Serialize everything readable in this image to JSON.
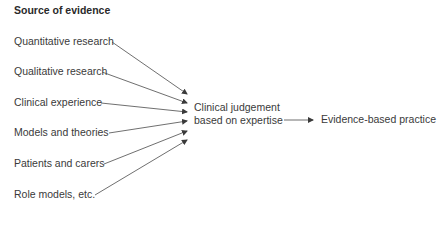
{
  "title": "Source of evidence",
  "sources": [
    {
      "label": "Quantitative research"
    },
    {
      "label": "Qualitative research"
    },
    {
      "label": "Clinical experience"
    },
    {
      "label": "Models and theories"
    },
    {
      "label": "Patients and carers"
    },
    {
      "label": "Role models, etc."
    }
  ],
  "center": {
    "line1": "Clinical judgement",
    "line2": "based on expertise"
  },
  "outcome": "Evidence-based practice",
  "colors": {
    "line": "#4a4a4a",
    "text": "#3a3a3a"
  }
}
